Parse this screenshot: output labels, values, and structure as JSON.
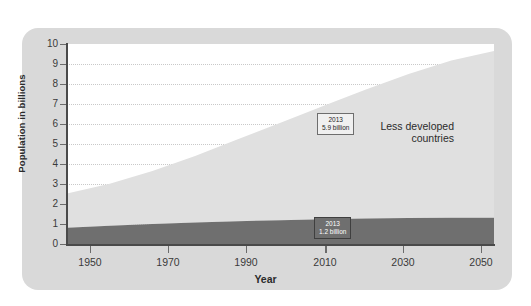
{
  "chart_data": {
    "type": "area",
    "title": "",
    "subtitle": "",
    "xlabel": "Year",
    "ylabel": "Population in billions",
    "xlim": [
      1950,
      2050
    ],
    "ylim": [
      0,
      10
    ],
    "grid": true,
    "stacked": true,
    "legend_position": "in-plot",
    "x_ticks": [
      "1950",
      "1970",
      "1990",
      "2010",
      "2030",
      "2050"
    ],
    "y_ticks": [
      "0",
      "1",
      "2",
      "3",
      "4",
      "5",
      "6",
      "7",
      "8",
      "9",
      "10"
    ],
    "x": [
      1950,
      1960,
      1970,
      1980,
      1990,
      2000,
      2010,
      2013,
      2020,
      2030,
      2040,
      2050
    ],
    "series": [
      {
        "name": "More developed countries",
        "color": "#6f6f6f",
        "values": [
          0.81,
          0.91,
          1.0,
          1.08,
          1.14,
          1.19,
          1.24,
          1.25,
          1.28,
          1.3,
          1.31,
          1.31
        ]
      },
      {
        "name": "Less developed countries",
        "color": "#e0e0e0",
        "values": [
          1.72,
          2.1,
          2.65,
          3.32,
          4.1,
          4.87,
          5.66,
          5.9,
          6.44,
          7.2,
          7.86,
          8.34
        ]
      }
    ],
    "totals": [
      2.53,
      3.01,
      3.65,
      4.4,
      5.24,
      6.06,
      6.9,
      7.15,
      7.72,
      8.5,
      9.17,
      9.65
    ],
    "annotations": [
      {
        "id": "callout-less-developed",
        "year": "2013",
        "value": "5.9 billion",
        "series": "Less developed countries",
        "style": "light-box-dark-text"
      },
      {
        "id": "callout-more-developed",
        "year": "2013",
        "value": "1.2 billion",
        "series": "More developed countries",
        "style": "dark-box-light-text"
      }
    ],
    "in_plot_labels": [
      {
        "id": "less-developed",
        "line1": "Less developed",
        "line2": "countries"
      },
      {
        "id": "more-developed",
        "line1": "More developed countries",
        "line2": ""
      }
    ]
  },
  "colors": {
    "panel_background": "#d9d9d9",
    "plot_background": "#ffffff",
    "axis": "#4a4a4a",
    "gridline": "#c9c9c9",
    "less_developed_fill": "#e0e0e0",
    "more_developed_fill": "#6f6f6f",
    "text": "#2b2b2b"
  }
}
